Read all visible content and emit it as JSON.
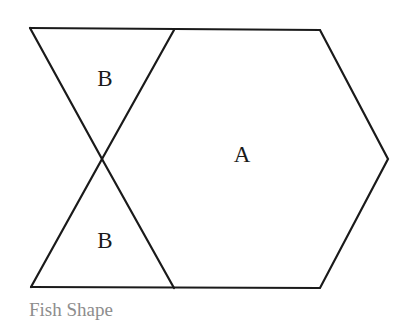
{
  "figure": {
    "caption": "Fish Shape",
    "background_color": "#ffffff",
    "stroke_color": "#1a1a1a",
    "stroke_width": 2.2,
    "caption_color": "#8d8d8d",
    "label_color": "#1a1a1a"
  },
  "diagram": {
    "type": "geometric-figure",
    "vertices": {
      "top_left": [
        30,
        28
      ],
      "top_middle": [
        174,
        30
      ],
      "top_right": [
        320,
        30
      ],
      "right_point": [
        388,
        159
      ],
      "bottom_right": [
        320,
        288
      ],
      "bottom_middle": [
        174,
        288
      ],
      "bottom_left": [
        31,
        287
      ],
      "crossing": [
        102,
        159
      ]
    },
    "edges": [
      {
        "name": "top-edge",
        "from": "top_left",
        "to": "top_right"
      },
      {
        "name": "upper-right-slant",
        "from": "top_right",
        "to": "right_point"
      },
      {
        "name": "lower-right-slant",
        "from": "right_point",
        "to": "bottom_right"
      },
      {
        "name": "bottom-edge",
        "from": "bottom_right",
        "to": "bottom_left"
      },
      {
        "name": "upper-left-slant",
        "from": "top_left",
        "to": "crossing"
      },
      {
        "name": "lower-left-slant",
        "from": "crossing",
        "to": "bottom_left"
      },
      {
        "name": "upper-inner-slant",
        "from": "top_middle",
        "to": "crossing"
      },
      {
        "name": "lower-inner-slant",
        "from": "crossing",
        "to": "bottom_middle"
      }
    ],
    "labels": [
      {
        "text": "B",
        "x": 105,
        "y": 78,
        "region": "upper-triangle"
      },
      {
        "text": "A",
        "x": 242,
        "y": 154,
        "region": "main-hexagon-body"
      },
      {
        "text": "B",
        "x": 105,
        "y": 240,
        "region": "lower-triangle"
      }
    ]
  }
}
